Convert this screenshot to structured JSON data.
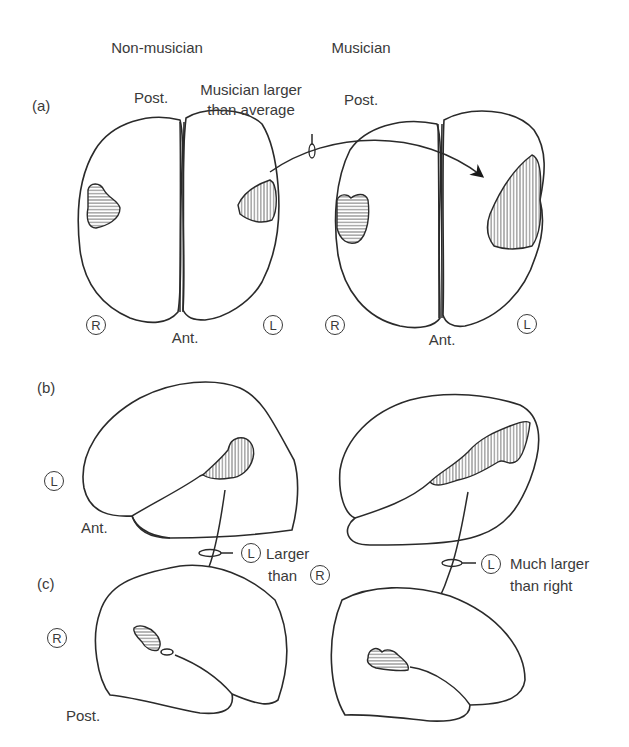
{
  "figure": {
    "columns": {
      "left": "Non-musician",
      "right": "Musician"
    },
    "panels": {
      "a": "(a)",
      "b": "(b)",
      "c": "(c)"
    },
    "orientation": {
      "post": "Post.",
      "ant": "Ant."
    },
    "hemisphere_marks": {
      "right": "R",
      "left": "L"
    },
    "annotations": {
      "a_arrow": "Musician larger than average",
      "a_arrow_line1": "Musician larger",
      "a_arrow_line2": "than average",
      "bc_left_line1": "Larger",
      "bc_left_line2": "than",
      "bc_left_full": "L Larger than R",
      "bc_right_line1": "Much larger",
      "bc_right_line2": "than right",
      "bc_right_full": "L Much larger than right"
    },
    "style": {
      "stroke_color": "#2a2a2a",
      "text_color": "#3a3a3a",
      "background": "#ffffff"
    }
  }
}
